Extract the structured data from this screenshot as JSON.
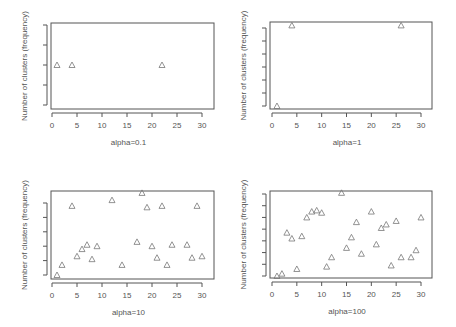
{
  "chart_data": [
    {
      "type": "scatter",
      "title": "",
      "xlabel": "alpha=0.1",
      "ylabel": "Number of clusters (frequency)",
      "xlim": [
        0,
        32
      ],
      "x_ticks": [
        0,
        5,
        10,
        15,
        20,
        25,
        30
      ],
      "y_tick_count": 5,
      "ylim": [
        0,
        4
      ],
      "grid": false,
      "marker": "triangle-open",
      "points": [
        {
          "x": 1,
          "y": 2
        },
        {
          "x": 4,
          "y": 2
        },
        {
          "x": 22,
          "y": 2
        }
      ]
    },
    {
      "type": "scatter",
      "title": "",
      "xlabel": "alpha=1",
      "ylabel": "Number of clusters (frequency)",
      "xlim": [
        0,
        32
      ],
      "x_ticks": [
        0,
        5,
        10,
        15,
        20,
        25,
        30
      ],
      "y_tick_count": 7,
      "ylim": [
        0,
        6
      ],
      "grid": false,
      "marker": "triangle-open",
      "points": [
        {
          "x": 1,
          "y": 0
        },
        {
          "x": 4,
          "y": 6.2
        },
        {
          "x": 26,
          "y": 6.2
        }
      ]
    },
    {
      "type": "scatter",
      "title": "",
      "xlabel": "alpha=10",
      "ylabel": "Number of clusters (frequency)",
      "xlim": [
        0,
        32
      ],
      "x_ticks": [
        0,
        5,
        10,
        15,
        20,
        25,
        30
      ],
      "y_tick_count": 6,
      "ylim": [
        0,
        5
      ],
      "grid": false,
      "marker": "triangle-open",
      "points": [
        {
          "x": 1,
          "y": 0
        },
        {
          "x": 2,
          "y": 0.7
        },
        {
          "x": 4,
          "y": 4.8
        },
        {
          "x": 5,
          "y": 1.3
        },
        {
          "x": 6,
          "y": 1.8
        },
        {
          "x": 7,
          "y": 2.1
        },
        {
          "x": 8,
          "y": 1.1
        },
        {
          "x": 9,
          "y": 2.0
        },
        {
          "x": 12,
          "y": 5.2
        },
        {
          "x": 14,
          "y": 0.7
        },
        {
          "x": 17,
          "y": 2.3
        },
        {
          "x": 18,
          "y": 5.7
        },
        {
          "x": 19,
          "y": 4.7
        },
        {
          "x": 20,
          "y": 2.0
        },
        {
          "x": 21,
          "y": 1.2
        },
        {
          "x": 22,
          "y": 4.8
        },
        {
          "x": 23,
          "y": 0.7
        },
        {
          "x": 24,
          "y": 2.1
        },
        {
          "x": 27,
          "y": 2.1
        },
        {
          "x": 28,
          "y": 1.2
        },
        {
          "x": 29,
          "y": 4.8
        },
        {
          "x": 30,
          "y": 1.3
        }
      ]
    },
    {
      "type": "scatter",
      "title": "",
      "xlabel": "alpha=100",
      "ylabel": "Number of clusters (frequency)",
      "xlim": [
        0,
        32
      ],
      "x_ticks": [
        0,
        5,
        10,
        15,
        20,
        25,
        30
      ],
      "y_tick_count": 8,
      "ylim": [
        0,
        7
      ],
      "grid": false,
      "marker": "triangle-open",
      "points": [
        {
          "x": 1,
          "y": 0
        },
        {
          "x": 2,
          "y": 0.2
        },
        {
          "x": 3,
          "y": 3.7
        },
        {
          "x": 4,
          "y": 3.2
        },
        {
          "x": 5,
          "y": 0.6
        },
        {
          "x": 6,
          "y": 3.4
        },
        {
          "x": 7,
          "y": 5.0
        },
        {
          "x": 8,
          "y": 5.5
        },
        {
          "x": 9,
          "y": 5.6
        },
        {
          "x": 10,
          "y": 5.4
        },
        {
          "x": 11,
          "y": 0.8
        },
        {
          "x": 12,
          "y": 1.6
        },
        {
          "x": 14,
          "y": 7.1
        },
        {
          "x": 15,
          "y": 2.4
        },
        {
          "x": 16,
          "y": 3.3
        },
        {
          "x": 17,
          "y": 4.6
        },
        {
          "x": 18,
          "y": 1.9
        },
        {
          "x": 20,
          "y": 5.5
        },
        {
          "x": 21,
          "y": 2.7
        },
        {
          "x": 22,
          "y": 4.1
        },
        {
          "x": 23,
          "y": 4.4
        },
        {
          "x": 24,
          "y": 0.9
        },
        {
          "x": 25,
          "y": 4.7
        },
        {
          "x": 26,
          "y": 1.6
        },
        {
          "x": 28,
          "y": 1.6
        },
        {
          "x": 29,
          "y": 2.2
        },
        {
          "x": 30,
          "y": 5.0
        }
      ]
    }
  ],
  "colors": {
    "axis": "#555555",
    "marker": "#777777",
    "text": "#555555"
  }
}
